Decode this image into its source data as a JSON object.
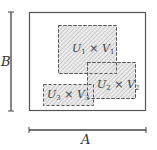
{
  "diagram": {
    "outer_rect": {
      "label_width": "A",
      "label_height": "B"
    },
    "axis_labels": {
      "A": "A",
      "B": "B"
    },
    "product_sets": [
      {
        "name": "U1×V1",
        "u": "U",
        "u_sub": "1",
        "times": "×",
        "v": "V",
        "v_sub": "1"
      },
      {
        "name": "U2×V2",
        "u": "U",
        "u_sub": "2",
        "times": "×",
        "v": "V",
        "v_sub": "2"
      },
      {
        "name": "U3×V3",
        "u": "U",
        "u_sub": "3",
        "times": "×",
        "v": "V",
        "v_sub": "3"
      }
    ],
    "colors": {
      "stroke": "#444444",
      "hatch": "#b0b0b0",
      "fill": "#e8e8e8"
    }
  }
}
